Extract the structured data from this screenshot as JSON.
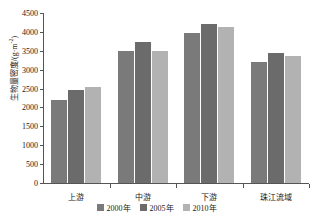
{
  "chart_data": {
    "type": "bar",
    "title": "",
    "xlabel": "",
    "ylabel": "生物量密度/(g·m",
    "ylabel_sup": "-2",
    "ylabel_tail": ")",
    "categories": [
      "上游",
      "中游",
      "下游",
      "珠江流域"
    ],
    "series": [
      {
        "name": "2000年",
        "color": "#7a7a7a",
        "values": [
          2200,
          3500,
          3980,
          3200
        ]
      },
      {
        "name": "2005年",
        "color": "#6b6b6b",
        "values": [
          2450,
          3730,
          4200,
          3450
        ]
      },
      {
        "name": "2010年",
        "color": "#b2b2b2",
        "values": [
          2530,
          3500,
          4120,
          3350
        ]
      }
    ],
    "ylim": [
      0,
      4500
    ],
    "ytick_values": [
      0,
      500,
      1000,
      1500,
      2000,
      2500,
      3000,
      3500,
      4000,
      4500
    ],
    "ytick_labels": [
      "0",
      "500",
      "1000",
      "1500",
      "2000",
      "2500",
      "3000",
      "3500",
      "4000",
      "4500"
    ],
    "grid": false,
    "legend_position": "bottom"
  }
}
